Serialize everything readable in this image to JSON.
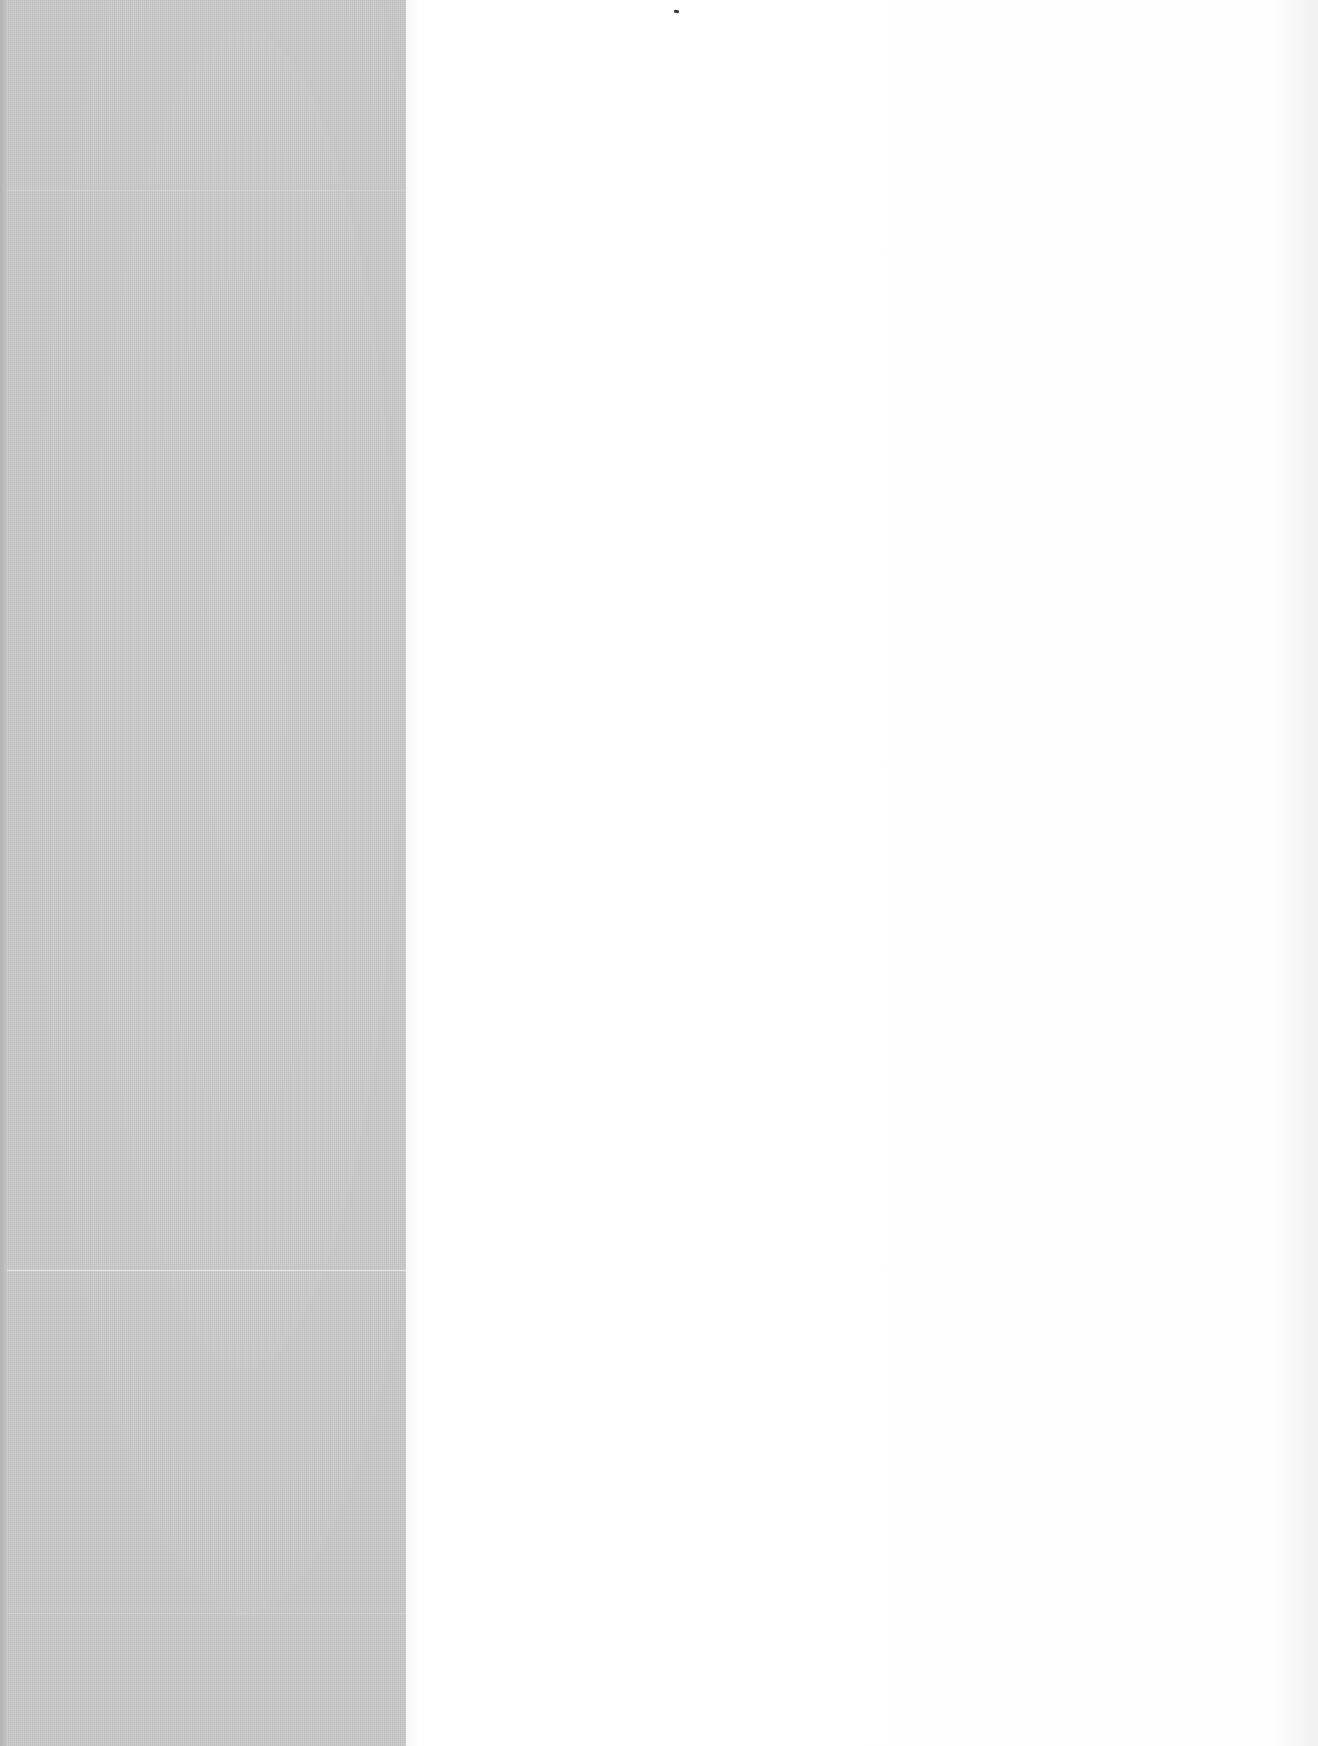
{
  "document": {
    "type": "scanned-blank-page",
    "left_panel": {
      "description": "gray cloth-textured endpaper",
      "color": "#c9c9c9"
    },
    "right_panel": {
      "description": "blank white page",
      "color": "#fdfdfd"
    },
    "text_content": ""
  }
}
